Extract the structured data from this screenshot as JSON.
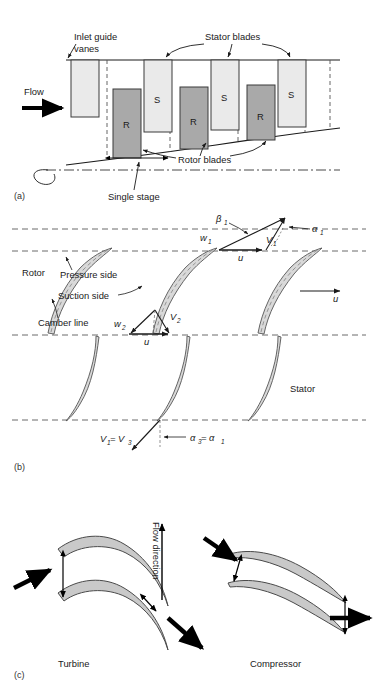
{
  "figure": {
    "type": "technical-diagram",
    "panels": [
      {
        "id": "(a)",
        "caption": "Axial compressor stage arrangement",
        "annotations": {
          "inlet_guide_vanes": "Inlet guide vanes",
          "inlet_guide_vanes_line1": "Inlet guide",
          "inlet_guide_vanes_line2": "vanes",
          "stator_blades": "Stator blades",
          "rotor_blades": "Rotor blades",
          "single_stage": "Single stage",
          "flow": "Flow"
        },
        "blade_labels": {
          "rotor": "R",
          "stator": "S"
        },
        "rotor_count": 3,
        "stator_count": 3,
        "igv_count": 1,
        "colors": {
          "stator_fill": "#eaeaea",
          "rotor_fill": "#a9a9a9",
          "outline": "#3a3a3a"
        }
      },
      {
        "id": "(b)",
        "caption": "Blade cascade with velocity triangles",
        "annotations": {
          "rotor": "Rotor",
          "stator": "Stator",
          "pressure_side": "Pressure side",
          "suction_side": "Suction side",
          "camber_line": "Camber line"
        },
        "velocity_triangle_inlet": {
          "beta1": "β",
          "beta1_sub": "1",
          "w1": "w",
          "w1_sub": "1",
          "v1": "V",
          "v1_sub": "1",
          "alpha1": "α",
          "alpha1_sub": "1",
          "u": "u"
        },
        "velocity_triangle_exit": {
          "w2": "w",
          "w2_sub": "2",
          "v2": "V",
          "v2_sub": "2",
          "u": "u"
        },
        "stator_exit": {
          "v_equality": "V",
          "v_equality_sub1": "1",
          "v_equality_mid": "= V",
          "v_equality_sub3": "3",
          "alpha_equality": "α",
          "alpha_equality_sub3": "3",
          "alpha_equality_mid": " = α",
          "alpha_equality_sub1": "1"
        },
        "blade_u_label": "u",
        "colors": {
          "blade_fill": "#d9d9d9",
          "outline": "#555555",
          "dash": "#444444"
        }
      },
      {
        "id": "(c)",
        "caption": "Turbine versus compressor blade passages",
        "annotations": {
          "turbine": "Turbine",
          "compressor": "Compressor",
          "flow_direction": "Flow direction"
        },
        "colors": {
          "blade_fill": "#c9c9c9",
          "outline": "#4a4a4a",
          "arrow": "#000000"
        }
      }
    ]
  }
}
